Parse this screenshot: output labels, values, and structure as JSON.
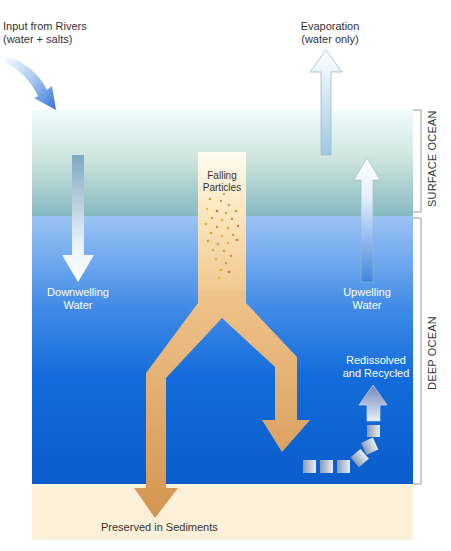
{
  "diagram": {
    "type": "ocean-salt-budget",
    "zones": {
      "surface": "SURFACE OCEAN",
      "deep": "DEEP OCEAN"
    },
    "labels": {
      "input_line1": "Input from Rivers",
      "input_line2": "(water + salts)",
      "evap_line1": "Evaporation",
      "evap_line2": "(water only)",
      "falling_line1": "Falling",
      "falling_line2": "Particles",
      "down_line1": "Downwelling",
      "down_line2": "Water",
      "up_line1": "Upwelling",
      "up_line2": "Water",
      "recycled_line1": "Redissolved",
      "recycled_line2": "and Recycled",
      "sediments": "Preserved in Sediments"
    },
    "colors": {
      "surface_top": "#eef9fb",
      "surface_bottom": "#8fbfc6",
      "deep_top": "#8ab8f2",
      "deep_bottom": "#0a5fcf",
      "sediment": "#fdf0d8",
      "particle_arrow": "#d9a263",
      "particle_column": "#fbe6bf"
    },
    "flows": [
      {
        "name": "river-input",
        "direction": "into-surface"
      },
      {
        "name": "evaporation",
        "direction": "up-out"
      },
      {
        "name": "downwelling",
        "direction": "down"
      },
      {
        "name": "upwelling",
        "direction": "up"
      },
      {
        "name": "falling-particles",
        "direction": "down-split"
      },
      {
        "name": "recycled",
        "direction": "up"
      },
      {
        "name": "sediment-burial",
        "direction": "down"
      }
    ]
  }
}
